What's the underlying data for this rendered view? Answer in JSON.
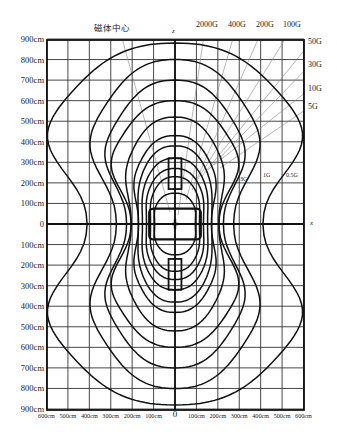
{
  "figure": {
    "title_label": "磁体中心",
    "axis_x_letter": "x",
    "axis_z_letter": "z",
    "y_tick_labels_top": [
      "900cm",
      "800cm",
      "700cm",
      "600cm",
      "500cm",
      "400cm",
      "300cm",
      "200cm",
      "100cm"
    ],
    "y_zero": "0",
    "y_tick_labels_bottom": [
      "100cm",
      "200cm",
      "300cm",
      "400cm",
      "500cm",
      "600cm",
      "700cm",
      "800cm",
      "900cm"
    ],
    "x_tick_labels_left": [
      "600cm",
      "500cm",
      "400cm",
      "300cm",
      "200cm",
      "100cm"
    ],
    "x_zero": "0",
    "x_tick_labels_right": [
      "100cm",
      "200cm",
      "300cm",
      "400cm",
      "500cm",
      "600cm"
    ],
    "top_gauss_labels": [
      "2000G",
      "400G",
      "200G",
      "100G"
    ],
    "right_gauss_labels": [
      "50G",
      "30G",
      "10G",
      "5G"
    ],
    "inner_gauss_labels": [
      "3G",
      "1G",
      "0.5G"
    ]
  },
  "chart_data": {
    "type": "contour",
    "xlabel": "x",
    "ylabel": "z",
    "xlim": [
      -600,
      600
    ],
    "ylim": [
      -900,
      900
    ],
    "units": "cm",
    "grid": true,
    "x_ticks": [
      -600,
      -500,
      -400,
      -300,
      -200,
      -100,
      0,
      100,
      200,
      300,
      400,
      500,
      600
    ],
    "y_ticks": [
      -900,
      -800,
      -700,
      -600,
      -500,
      -400,
      -300,
      -200,
      -100,
      0,
      100,
      200,
      300,
      400,
      500,
      600,
      700,
      800,
      900
    ],
    "contour_levels_gauss": [
      2000,
      400,
      200,
      100,
      50,
      30,
      10,
      5,
      3,
      1,
      0.5
    ],
    "approx_contour_extents_cm": [
      {
        "level": "2000G",
        "x_half_width": 100,
        "z_half_height": 150
      },
      {
        "level": "400G",
        "x_half_width": 120,
        "z_half_height": 230
      },
      {
        "level": "200G",
        "x_half_width": 140,
        "z_half_height": 270
      },
      {
        "level": "100G",
        "x_half_width": 160,
        "z_half_height": 320
      },
      {
        "level": "50G",
        "x_half_width": 180,
        "z_half_height": 380
      },
      {
        "level": "30G",
        "x_half_width": 200,
        "z_half_height": 430
      },
      {
        "level": "10G",
        "x_half_width": 240,
        "z_half_height": 520
      },
      {
        "level": "5G",
        "x_half_width": 300,
        "z_half_height": 600
      },
      {
        "level": "3G",
        "x_half_width": 330,
        "z_half_height": 700
      },
      {
        "level": "1G",
        "x_half_width": 400,
        "z_half_height": 800
      },
      {
        "level": "0.5G",
        "x_half_width": 600,
        "z_half_height": 880
      }
    ]
  }
}
